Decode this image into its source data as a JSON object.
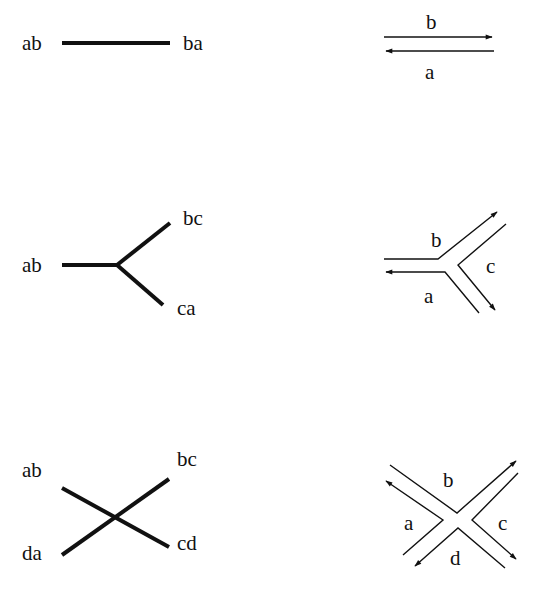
{
  "colors": {
    "stroke": "#111111",
    "background": "#ffffff"
  },
  "rows": [
    {
      "graph": {
        "labels": [
          {
            "text": "ab",
            "x": 22,
            "y": 50
          },
          {
            "text": "ba",
            "x": 183,
            "y": 50
          }
        ],
        "edges": [
          "M62,43 L170,43"
        ]
      },
      "ribbon": {
        "labels": [
          {
            "text": "b",
            "x": 426,
            "y": 29
          },
          {
            "text": "a",
            "x": 425,
            "y": 79
          }
        ],
        "paths": [
          {
            "d": "M384,37 L492,37",
            "arrow": "end"
          },
          {
            "d": "M386,51 L494,51",
            "arrow": "start"
          }
        ]
      }
    },
    {
      "graph": {
        "labels": [
          {
            "text": "ab",
            "x": 22,
            "y": 272
          },
          {
            "text": "bc",
            "x": 183,
            "y": 225
          },
          {
            "text": "ca",
            "x": 177,
            "y": 315
          }
        ],
        "edges": [
          "M62,265 L117,265",
          "M117,265 L170,223",
          "M117,265 L163,305"
        ]
      },
      "ribbon": {
        "labels": [
          {
            "text": "b",
            "x": 431,
            "y": 247
          },
          {
            "text": "c",
            "x": 486,
            "y": 273
          },
          {
            "text": "a",
            "x": 424,
            "y": 303
          }
        ],
        "paths": [
          {
            "d": "M384,259 L438,259 L497,212",
            "arrow": "end"
          },
          {
            "d": "M386,272 L445,272 L479,313",
            "arrow": "start"
          },
          {
            "d": "M506,224 L458,265 L495,310",
            "arrow": "end"
          }
        ]
      }
    },
    {
      "graph": {
        "labels": [
          {
            "text": "ab",
            "x": 22,
            "y": 477
          },
          {
            "text": "bc",
            "x": 177,
            "y": 466
          },
          {
            "text": "cd",
            "x": 177,
            "y": 550
          },
          {
            "text": "da",
            "x": 22,
            "y": 560
          }
        ],
        "edges": [
          "M62,488 L169,547",
          "M62,555 L169,479"
        ]
      },
      "ribbon": {
        "labels": [
          {
            "text": "b",
            "x": 443,
            "y": 487
          },
          {
            "text": "a",
            "x": 404,
            "y": 530
          },
          {
            "text": "c",
            "x": 498,
            "y": 530
          },
          {
            "text": "d",
            "x": 450,
            "y": 565
          }
        ],
        "paths": [
          {
            "d": "M390,465 L457,513 L516,461",
            "arrow": "end"
          },
          {
            "d": "M518,473 L472,520 L516,559",
            "arrow": "end"
          },
          {
            "d": "M415,566 L458,528 L505,568",
            "arrow": "start"
          },
          {
            "d": "M386,481 L443,520 L403,555",
            "arrow": "start"
          }
        ]
      }
    }
  ]
}
